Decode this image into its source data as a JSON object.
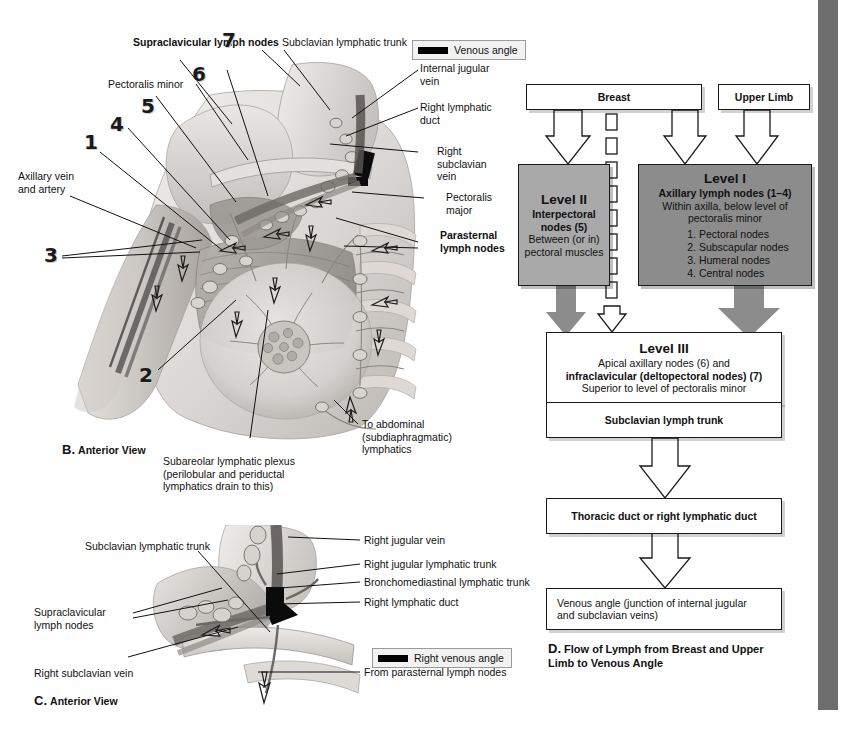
{
  "figure": {
    "panel_b": {
      "caption_letter": "B.",
      "caption_text": "Anterior View",
      "legend": {
        "icon": "black-bar-swatch",
        "label": "Venous angle"
      },
      "callout_numbers": [
        "1",
        "2",
        "3",
        "4",
        "5",
        "6",
        "7"
      ],
      "labels": {
        "supraclavicular_lymph_nodes": "Supraclavicular lymph nodes",
        "subclavian_lymphatic_trunk": "Subclavian lymphatic trunk",
        "pectoralis_minor": "Pectoralis minor",
        "axillary_vein_and_artery": "Axillary vein\nand artery",
        "internal_jugular_vein": "Internal jugular\nvein",
        "right_lymphatic_duct": "Right lymphatic\nduct",
        "right_subclavian_vein": "Right\nsubclavian\nvein",
        "pectoralis_major": "Pectoralis\nmajor",
        "parasternal_lymph_nodes": "Parasternal\nlymph nodes",
        "to_abdominal_lymphatics": "To abdominal\n(subdiaphragmatic)\nlymphatics",
        "subareolar_plexus": "Subareolar lymphatic plexus\n(perilobular and periductal\nlymphatics drain to this)"
      }
    },
    "panel_c": {
      "caption_letter": "C.",
      "caption_text": "Anterior View",
      "legend": {
        "icon": "black-bar-swatch",
        "label": "Right venous angle"
      },
      "labels": {
        "subclavian_lymphatic_trunk": "Subclavian lymphatic trunk",
        "supraclavicular_lymph_nodes": "Supraclavicular\nlymph nodes",
        "right_subclavian_vein": "Right subclavian vein",
        "right_jugular_vein": "Right jugular vein",
        "right_jugular_lymphatic_trunk": "Right jugular lymphatic trunk",
        "bronchomediastinal_lymphatic_trunk": "Bronchomediastinal lymphatic trunk",
        "right_lymphatic_duct": "Right lymphatic duct",
        "from_parasternal_lymph_nodes": "From parasternal lymph nodes"
      }
    },
    "panel_d": {
      "caption_letter": "D.",
      "caption_text": "Flow of Lymph from Breast and Upper\nLimb to Venous Angle",
      "colors": {
        "level_one_fill": "#8c8c8c",
        "level_two_fill": "#a9a9a9",
        "box_fill": "#ffffff",
        "stroke": "#1a1a1a"
      },
      "nodes": {
        "breast": {
          "label": "Breast"
        },
        "upper_limb": {
          "label": "Upper Limb"
        },
        "level_two": {
          "title": "Level II",
          "subtitle": "Interpectoral",
          "subtitle2": "nodes (5)",
          "detail": "Between (or in)\npectoral muscles"
        },
        "level_one": {
          "title": "Level I",
          "subtitle": "Axillary lymph nodes (1–4)",
          "detail": "Within axilla, below level of\npectoralis minor",
          "items": [
            "1. Pectoral nodes",
            "2. Subscapular nodes",
            "3. Humeral nodes",
            "4. Central nodes"
          ]
        },
        "level_three": {
          "title": "Level III",
          "line1": "Apical axillary nodes (6) and",
          "line2": "infraclavicular (deltopectoral nodes) (7)",
          "line3": "Superior to level of pectoralis minor"
        },
        "subclavian_lymph_trunk": {
          "label": "Subclavian lymph trunk"
        },
        "thoracic_duct": {
          "label": "Thoracic duct or right lymphatic duct"
        },
        "venous_angle": {
          "label": "Venous angle (junction of internal jugular\nand subclavian veins)"
        }
      }
    }
  }
}
